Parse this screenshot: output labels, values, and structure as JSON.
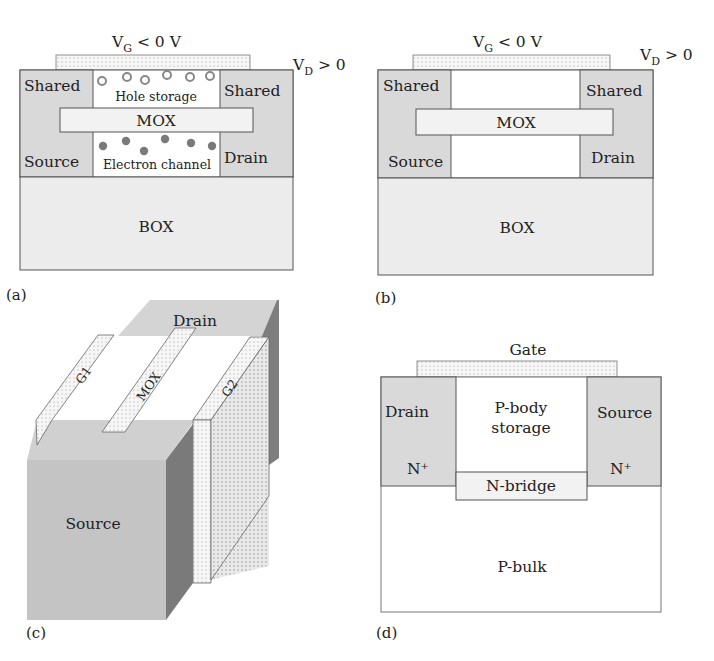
{
  "colors": {
    "region_gray": "#d9d9d9",
    "region_dark": "#a6a6a6",
    "region_mid": "#c4c4c4",
    "box_fill": "#ececec",
    "gate_fill": "#f2f2f2",
    "outline": "#555555",
    "hole": "#888888",
    "electron": "#7a7a7a"
  },
  "panel_a": {
    "label": "(a)",
    "gate_voltage_base": "V",
    "gate_voltage_sub": "G",
    "gate_voltage_rest": " < 0 V",
    "drain_voltage_base": "V",
    "drain_voltage_sub": "D",
    "drain_voltage_rest": " > 0",
    "left_top": "Shared",
    "left_bottom": "Source",
    "right_top": "Shared",
    "right_bottom": "Drain",
    "mox": "MOX",
    "hole_storage": "Hole storage",
    "electron_channel": "Electron channel",
    "box": "BOX"
  },
  "panel_b": {
    "label": "(b)",
    "gate_voltage_base": "V",
    "gate_voltage_sub": "G",
    "gate_voltage_rest": " < 0 V",
    "drain_voltage_base": "V",
    "drain_voltage_sub": "D",
    "drain_voltage_rest": " > 0",
    "left_top": "Shared",
    "left_bottom": "Source",
    "right_top": "Shared",
    "right_bottom": "Drain",
    "mox": "MOX",
    "box": "BOX"
  },
  "panel_c": {
    "label": "(c)",
    "drain": "Drain",
    "source": "Source",
    "gate1": "G1",
    "mox": "MOX",
    "gate2": "G2"
  },
  "panel_d": {
    "label": "(d)",
    "gate": "Gate",
    "drain": "Drain",
    "drain_doping": "N⁺",
    "source": "Source",
    "source_doping": "N⁺",
    "body_line1": "P-body",
    "body_line2": "storage",
    "bridge": "N-bridge",
    "bulk": "P-bulk"
  }
}
